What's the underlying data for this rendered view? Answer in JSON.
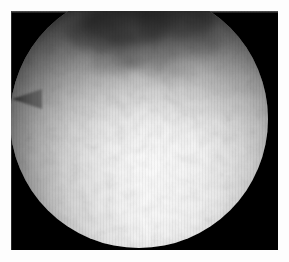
{
  "image": {
    "kind": "astronomical-photograph",
    "subject": "bright circular celestial disk",
    "alt_text": "Grayscale astronomical photograph of a large bright circular disk filling most of a black photographic frame",
    "orientation": "landscape",
    "color_mode": "grayscale"
  },
  "canvas": {
    "width_px": 289,
    "height_px": 262,
    "background_color": "#fdfdfd"
  },
  "frame": {
    "name": "photographic-plate",
    "left_px": 11,
    "top_px": 11,
    "width_px": 267,
    "height_px": 239,
    "background_color": "#000000",
    "margin_color": "#fdfdfd",
    "hairline_color": "#6e6e6e"
  },
  "disk": {
    "name": "celestial-disk",
    "center_x_px": 139,
    "center_y_px": 119,
    "radius_px": 129,
    "cropped_at_top": true,
    "highlight_color": "#fdfdfd",
    "midtone_color": "#cfcfcf",
    "limb_color": "#3a3a3a",
    "brightest_region": "lower-center",
    "darkest_region": "upper-limb"
  },
  "features": [
    {
      "name": "dark-mottled-region",
      "description": "Dark granular filament-like mottling across the upper third of the disk",
      "center_x_px": 140,
      "center_y_px": 55,
      "tone": "#3d3d3d"
    },
    {
      "name": "prominence-spike",
      "description": "Faint triangular protrusion extending left from the limb",
      "center_x_px": 16,
      "center_y_px": 99,
      "tone": "#454545"
    },
    {
      "name": "bright-core",
      "description": "Saturated near-white central and lower portion of the disk",
      "center_x_px": 150,
      "center_y_px": 165,
      "tone": "#fdfdfd"
    },
    {
      "name": "limb-darkening-ring",
      "description": "Gradual darkening toward the circular edge of the disk",
      "tone": "#111111"
    }
  ],
  "texture": {
    "name": "photographic-grain",
    "description": "Fine mottled granulation and faint vertical scan streaks across the plate",
    "opacity": 0.3
  }
}
